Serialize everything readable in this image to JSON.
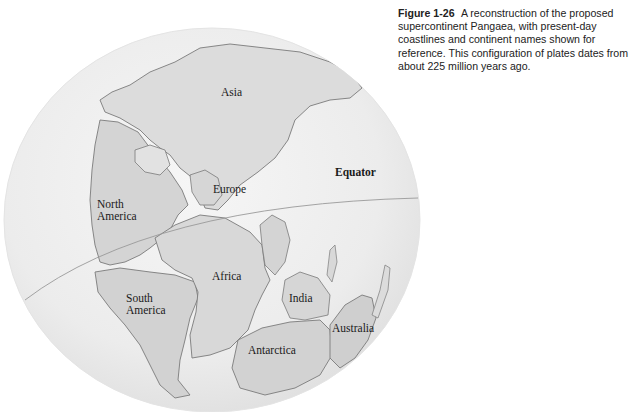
{
  "caption": {
    "figure_number": "Figure 1-26",
    "text": "A reconstruction of the proposed supercontinent Pangaea, with present-day coastlines and continent names shown for reference. This configuration of plates dates from about 225 million years ago."
  },
  "map": {
    "labels": {
      "asia": "Asia",
      "europe": "Europe",
      "north_america_1": "North",
      "north_america_2": "America",
      "south_america_1": "South",
      "south_america_2": "America",
      "africa": "Africa",
      "india": "India",
      "australia": "Australia",
      "antarctica": "Antarctica",
      "equator": "Equator"
    },
    "colors": {
      "globe_fill": "#eeeeee",
      "land_fill": "#dcdcdc",
      "coastline": "#7a7a7a",
      "equator_line": "#9a9a9a"
    }
  }
}
